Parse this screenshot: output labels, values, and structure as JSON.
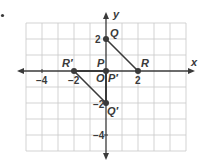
{
  "diagram": {
    "type": "coordinate-plane",
    "bullet": "•",
    "axes": {
      "x_label": "x",
      "y_label": "y",
      "x_ticks": [
        {
          "value": -4,
          "label": "−4"
        },
        {
          "value": -2,
          "label": "−2"
        },
        {
          "value": 2,
          "label": "2"
        }
      ],
      "y_ticks": [
        {
          "value": 2,
          "label": "2"
        },
        {
          "value": -2,
          "label": "−2"
        },
        {
          "value": -4,
          "label": "−4"
        }
      ],
      "origin_label": "O",
      "x_range": [
        -5,
        5
      ],
      "y_range": [
        -5,
        3
      ]
    },
    "points": [
      {
        "name": "P",
        "label": "P",
        "x": 0,
        "y": 0
      },
      {
        "name": "Q",
        "label": "Q",
        "x": 0,
        "y": 2
      },
      {
        "name": "R",
        "label": "R",
        "x": 2,
        "y": 0
      },
      {
        "name": "P-prime",
        "label": "P′",
        "x": 0,
        "y": 0
      },
      {
        "name": "Q-prime",
        "label": "Q′",
        "x": 0,
        "y": -2
      },
      {
        "name": "R-prime",
        "label": "R′",
        "x": -2,
        "y": 0
      }
    ],
    "segments": [
      {
        "name": "segment-QR",
        "from": "Q",
        "to": "R"
      },
      {
        "name": "segment-PQ",
        "from": "P",
        "to": "Q"
      },
      {
        "name": "segment-PR",
        "from": "P",
        "to": "R"
      },
      {
        "name": "segment-R-prime-Q-prime",
        "from": "R′",
        "to": "Q′"
      },
      {
        "name": "segment-P-prime-Q-prime",
        "from": "P′",
        "to": "Q′"
      },
      {
        "name": "segment-P-prime-R-prime",
        "from": "P′",
        "to": "R′"
      }
    ],
    "colors": {
      "grid": "#c8c8c8",
      "axis": "#3a3a3a",
      "segment": "#3a3a3a",
      "point": "#3a3a3a",
      "text": "#3a3a3a"
    }
  }
}
